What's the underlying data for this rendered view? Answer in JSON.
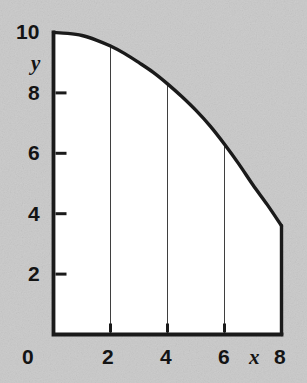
{
  "figure": {
    "background_color": "#c9c9c9",
    "plot_fill_color": "#ffffff",
    "axis_color": "#1a1a1a",
    "curve_color": "#1a1a1a",
    "gridline_color": "#4d4d4d"
  },
  "chart_data": {
    "type": "area",
    "title": "",
    "xlabel": "x",
    "ylabel": "y",
    "xlim": [
      0,
      8
    ],
    "ylim": [
      0,
      10
    ],
    "xticks": [
      0,
      2,
      4,
      6,
      8
    ],
    "xticklabels": [
      "0",
      "2",
      "4",
      "6",
      "8"
    ],
    "yticks": [
      0,
      2,
      4,
      6,
      8,
      10
    ],
    "yticklabels": [
      "0",
      "2",
      "4",
      "6",
      "8",
      "10"
    ],
    "grid": "vertical-only",
    "gridlines_x": [
      2,
      4,
      6
    ],
    "legend": null,
    "series": [
      {
        "name": "curve",
        "x": [
          0,
          0.5,
          1,
          1.5,
          2,
          2.5,
          3,
          3.5,
          4,
          4.5,
          5,
          5.5,
          6,
          6.5,
          7,
          7.5,
          8
        ],
        "y": [
          10.0,
          9.97,
          9.9,
          9.75,
          9.55,
          9.3,
          9.0,
          8.68,
          8.3,
          7.88,
          7.42,
          6.9,
          6.3,
          5.65,
          4.95,
          4.3,
          3.6
        ]
      }
    ],
    "annotations": [],
    "strip_tops": [
      {
        "x": 2,
        "y": 9.55
      },
      {
        "x": 4,
        "y": 8.3
      },
      {
        "x": 6,
        "y": 6.3
      },
      {
        "x": 8,
        "y": 3.6
      }
    ]
  },
  "labels": {
    "y_axis_name": "y",
    "x_axis_name": "x",
    "origin": "0",
    "y_10": "10",
    "y_8": "8",
    "y_6": "6",
    "y_4": "4",
    "y_2": "2",
    "x_2": "2",
    "x_4": "4",
    "x_6": "6",
    "x_8": "8"
  }
}
